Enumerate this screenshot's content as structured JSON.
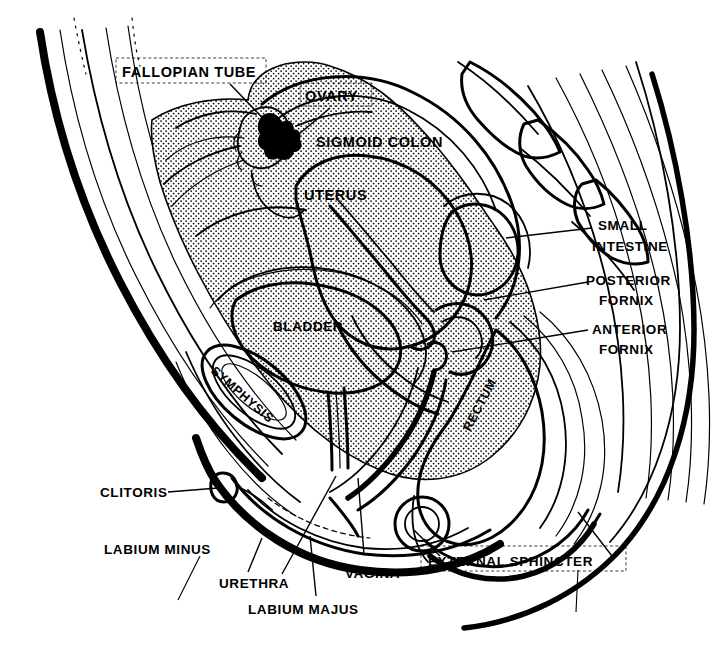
{
  "figure": {
    "kind": "anatomical-line-diagram",
    "style": "black ink line art with stippled fill",
    "background_color": "#ffffff",
    "ink_color": "#000000",
    "width": 718,
    "height": 652
  },
  "labels": {
    "fallopian_tube": "FALLOPIAN TUBE",
    "ovary": "OVARY",
    "sigmoid_colon": "SIGMOID COLON",
    "uterus": "UTERUS",
    "small_intestine_line1": "SMALL",
    "small_intestine_line2": "INTESTINE",
    "posterior_fornix_line1": "POSTERIOR",
    "posterior_fornix_line2": "FORNIX",
    "anterior_fornix_line1": "ANTERIOR",
    "anterior_fornix_line2": "FORNIX",
    "bladder": "BLADDER",
    "symphysis": "SYMPHYSIS",
    "rectum": "RECTUM",
    "clitoris": "CLITORIS",
    "labium_minus": "LABIUM MINUS",
    "urethra": "URETHRA",
    "labium_majus": "LABIUM MAJUS",
    "vagina": "VAGINA",
    "external_sphincter": "EXTERNAL SPHINCTER"
  },
  "boxed_labels": [
    "FALLOPIAN TUBE",
    "OVARY",
    "EXTERNAL SPHINCTER"
  ],
  "structures": [
    "abdominal wall",
    "sacrum and coccyx vertebrae",
    "gluteal muscle striations",
    "sigmoid colon",
    "uterus",
    "fallopian tube",
    "ovary",
    "small intestine",
    "posterior fornix",
    "anterior fornix",
    "bladder",
    "pubic symphysis",
    "urethra",
    "vagina",
    "rectum",
    "external anal sphincter",
    "labium majus",
    "labium minus",
    "clitoris"
  ]
}
